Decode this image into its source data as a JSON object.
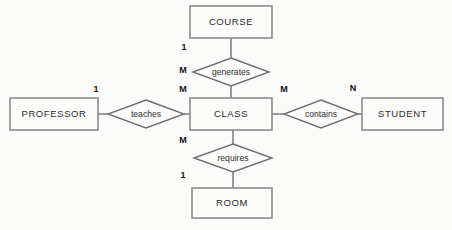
{
  "diagram": {
    "type": "entity-relationship-diagram",
    "background_color": "#fbfbf9",
    "entity_border_color": "#8b8b8b",
    "relationship_border_color": "#6f6f6f",
    "line_color": "#7c7c7c",
    "text_color": "#2a2a2a",
    "entities": [
      {
        "id": "course",
        "label": "COURSE",
        "x": 190,
        "y": 6,
        "w": 82,
        "h": 32
      },
      {
        "id": "professor",
        "label": "PROFESSOR",
        "x": 10,
        "y": 98,
        "w": 88,
        "h": 32
      },
      {
        "id": "class",
        "label": "CLASS",
        "x": 190,
        "y": 98,
        "w": 82,
        "h": 32
      },
      {
        "id": "student",
        "label": "STUDENT",
        "x": 362,
        "y": 98,
        "w": 81,
        "h": 32
      },
      {
        "id": "room",
        "label": "ROOM",
        "x": 192,
        "y": 188,
        "w": 80,
        "h": 30
      }
    ],
    "relationships": [
      {
        "id": "generates",
        "label": "generates",
        "cx": 231,
        "cy": 72,
        "rx": 38,
        "ry": 14
      },
      {
        "id": "teaches",
        "label": "teaches",
        "cx": 146,
        "cy": 114,
        "rx": 38,
        "ry": 14
      },
      {
        "id": "contains",
        "label": "contains",
        "cx": 321,
        "cy": 114,
        "rx": 37,
        "ry": 14
      },
      {
        "id": "requires",
        "label": "requires",
        "cx": 233,
        "cy": 158,
        "rx": 39,
        "ry": 14
      }
    ],
    "connections": [
      {
        "id": "course-generates",
        "from": "course",
        "to": "generates",
        "x1": 231,
        "y1": 38,
        "x2": 231,
        "y2": 58
      },
      {
        "id": "generates-class",
        "from": "generates",
        "to": "class",
        "x1": 231,
        "y1": 86,
        "x2": 231,
        "y2": 98
      },
      {
        "id": "professor-teaches",
        "from": "professor",
        "to": "teaches",
        "x1": 98,
        "y1": 114,
        "x2": 108,
        "y2": 114
      },
      {
        "id": "teaches-class",
        "from": "teaches",
        "to": "class",
        "x1": 184,
        "y1": 114,
        "x2": 190,
        "y2": 114
      },
      {
        "id": "class-contains",
        "from": "class",
        "to": "contains",
        "x1": 272,
        "y1": 114,
        "x2": 284,
        "y2": 114
      },
      {
        "id": "contains-student",
        "from": "contains",
        "to": "student",
        "x1": 358,
        "y1": 114,
        "x2": 362,
        "y2": 114
      },
      {
        "id": "class-requires",
        "from": "class",
        "to": "requires",
        "x1": 233,
        "y1": 130,
        "x2": 233,
        "y2": 144
      },
      {
        "id": "requires-room",
        "from": "requires",
        "to": "room",
        "x1": 233,
        "y1": 172,
        "x2": 233,
        "y2": 188
      }
    ],
    "cardinalities": [
      {
        "id": "course-side",
        "value": "1",
        "x": 184,
        "y": 48,
        "relationship": "generates",
        "entity": "course"
      },
      {
        "id": "class-top",
        "value": "M",
        "x": 183,
        "y": 71,
        "relationship": "generates",
        "entity": "class"
      },
      {
        "id": "class-left",
        "value": "M",
        "x": 183,
        "y": 90,
        "relationship": "teaches",
        "entity": "class"
      },
      {
        "id": "professor-side",
        "value": "1",
        "x": 96,
        "y": 90,
        "relationship": "teaches",
        "entity": "professor"
      },
      {
        "id": "class-right",
        "value": "M",
        "x": 284,
        "y": 90,
        "relationship": "contains",
        "entity": "class"
      },
      {
        "id": "student-side",
        "value": "N",
        "x": 353,
        "y": 89,
        "relationship": "contains",
        "entity": "student"
      },
      {
        "id": "class-bottom",
        "value": "M",
        "x": 183,
        "y": 141,
        "relationship": "requires",
        "entity": "class"
      },
      {
        "id": "room-side",
        "value": "1",
        "x": 183,
        "y": 176,
        "relationship": "requires",
        "entity": "room"
      }
    ]
  }
}
